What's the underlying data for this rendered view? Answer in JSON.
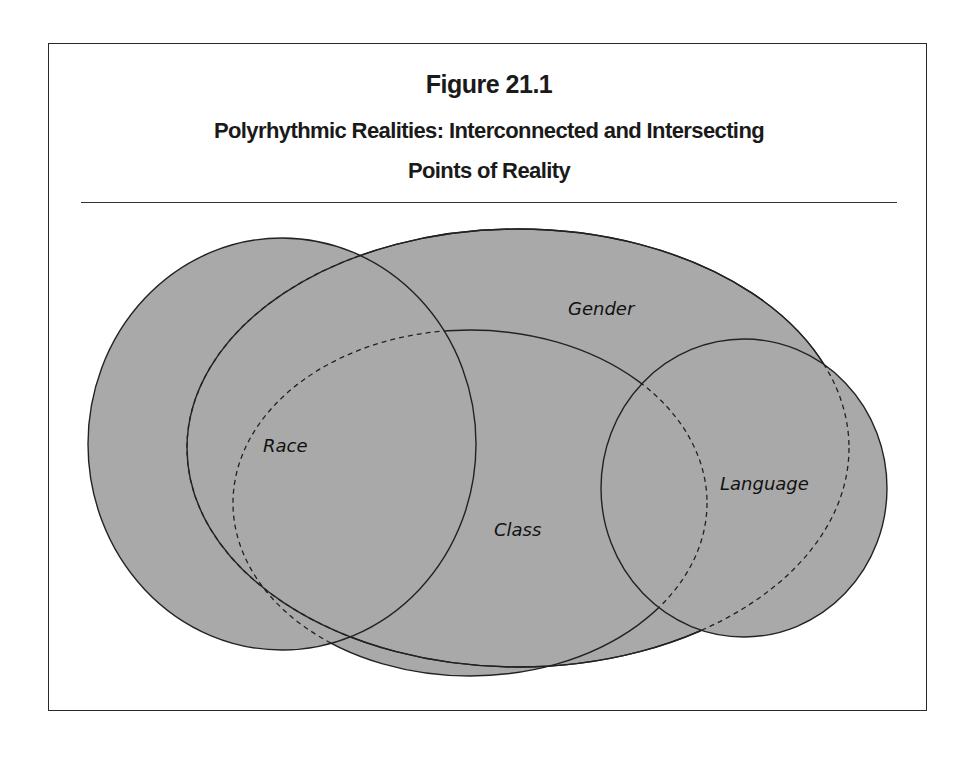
{
  "figure": {
    "number": "Figure 21.1",
    "title_line1": "Polyrhythmic Realities: Interconnected and Intersecting",
    "title_line2": "Points of Reality"
  },
  "diagram": {
    "type": "venn",
    "fill_color": "#a9a9a9",
    "stroke_color": "#222222",
    "sets": [
      {
        "id": "race",
        "label": "Race"
      },
      {
        "id": "gender",
        "label": "Gender"
      },
      {
        "id": "class",
        "label": "Class"
      },
      {
        "id": "language",
        "label": "Language"
      }
    ]
  }
}
